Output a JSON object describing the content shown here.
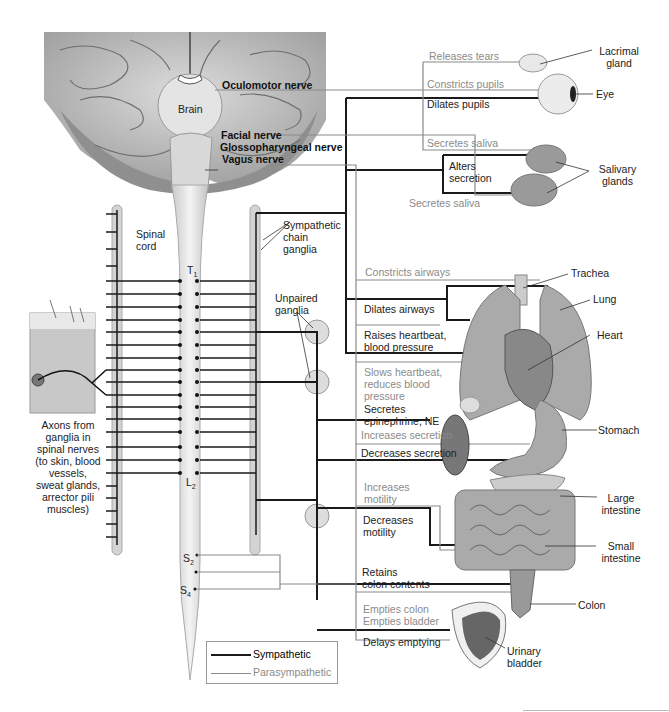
{
  "diagram": {
    "type": "autonomic-nervous-system-innervation",
    "colors": {
      "sympathetic": "#1a1a1a",
      "parasympathetic": "#8a8a8a",
      "background": "#ffffff",
      "organ_fill": "#bdbdbd"
    },
    "cns_labels": {
      "brain": "Brain",
      "spinal_cord": "Spinal\ncord",
      "t1": "T",
      "t1_sub": "1",
      "l2": "L",
      "l2_sub": "2",
      "s2": "S",
      "s2_sub": "2",
      "s4": "S",
      "s4_sub": "4"
    },
    "cranial_nerves": [
      {
        "label": "Oculomotor nerve"
      },
      {
        "label": "Facial nerve"
      },
      {
        "label": "Glossopharyngeal nerve"
      },
      {
        "label": "Vagus nerve"
      }
    ],
    "ganglia_labels": {
      "sympathetic_chain": "Sympathetic\nchain\nganglia",
      "unpaired": "Unpaired\nganglia"
    },
    "skin_caption": "Axons from\nganglia in\nspinal nerves\n(to skin, blood\nvessels,\nsweat glands,\narrector pili\nmuscles)",
    "effects": [
      {
        "text": "Releases tears",
        "system": "parasympathetic"
      },
      {
        "text": "Constricts pupils",
        "system": "parasympathetic"
      },
      {
        "text": "Dilates pupils",
        "system": "sympathetic"
      },
      {
        "text": "Secretes saliva",
        "system": "parasympathetic"
      },
      {
        "text": "Alters\nsecretion",
        "system": "sympathetic"
      },
      {
        "text": "Secretes saliva",
        "system": "parasympathetic"
      },
      {
        "text": "Constricts airways",
        "system": "parasympathetic"
      },
      {
        "text": "Dilates airways",
        "system": "sympathetic"
      },
      {
        "text": "Raises heartbeat,\nblood pressure",
        "system": "sympathetic"
      },
      {
        "text": "Slows heartbeat,\nreduces blood\npressure",
        "system": "parasympathetic"
      },
      {
        "text": "Secretes\nepinephrine, NE",
        "system": "sympathetic"
      },
      {
        "text": "Increases secretion",
        "system": "parasympathetic"
      },
      {
        "text": "Decreases secretion",
        "system": "sympathetic"
      },
      {
        "text": "Increases\nmotility",
        "system": "parasympathetic"
      },
      {
        "text": "Decreases\nmotility",
        "system": "sympathetic"
      },
      {
        "text": "Retains\ncolon contents",
        "system": "sympathetic"
      },
      {
        "text": "Empties colon\nEmpties bladder",
        "system": "parasympathetic"
      },
      {
        "text": "Delays emptying",
        "system": "sympathetic"
      }
    ],
    "organs": [
      {
        "label": "Lacrimal\ngland"
      },
      {
        "label": "Eye"
      },
      {
        "label": "Salivary\nglands"
      },
      {
        "label": "Trachea"
      },
      {
        "label": "Lung"
      },
      {
        "label": "Heart"
      },
      {
        "label": "Stomach"
      },
      {
        "label": "Large\nintestine"
      },
      {
        "label": "Small\nintestine"
      },
      {
        "label": "Colon"
      },
      {
        "label": "Urinary\nbladder"
      }
    ],
    "legend": [
      {
        "label": "Sympathetic",
        "color": "#1a1a1a",
        "weight": 2
      },
      {
        "label": "Parasympathetic",
        "color": "#8a8a8a",
        "weight": 1
      }
    ]
  }
}
